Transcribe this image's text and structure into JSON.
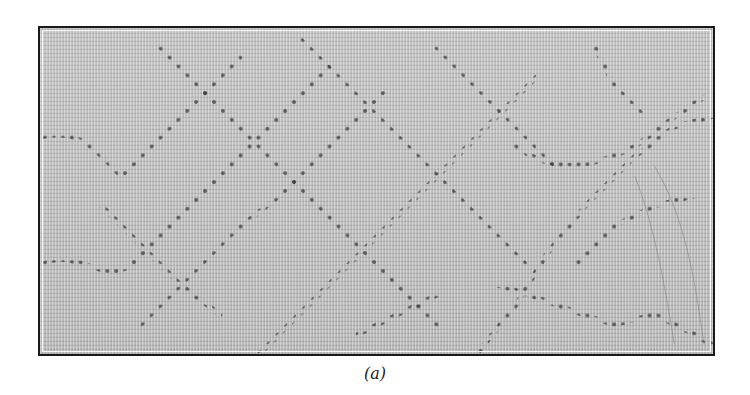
{
  "figure": {
    "caption": "(a)",
    "colors": {
      "background": "#ffffff",
      "frame_border": "#1a1a1a",
      "fabric_base": "#bdbdbd",
      "dot_color": "#2a2a2a"
    }
  }
}
